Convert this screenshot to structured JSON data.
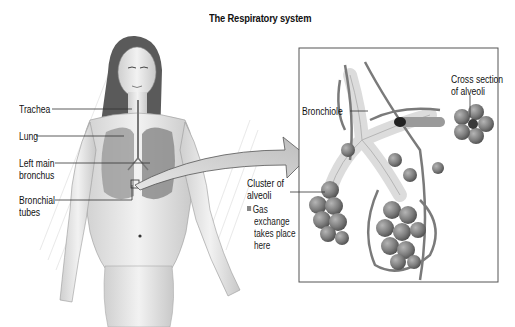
{
  "title": "The Respiratory system",
  "body_labels": {
    "trachea": "Trachea",
    "lung": "Lung",
    "left_main_bronchus_1": "Left main",
    "left_main_bronchus_2": "bronchus",
    "bronchial_tubes_1": "Bronchial",
    "bronchial_tubes_2": "tubes"
  },
  "detail_labels": {
    "bronchiole": "Bronchiole",
    "cross_section_1": "Cross section",
    "cross_section_2": "of alveoli",
    "cluster_1": "Cluster of",
    "cluster_2": "alveoli",
    "note_1": "Gas",
    "note_2": "exchange",
    "note_3": "takes place",
    "note_4": "here"
  },
  "colors": {
    "ink": "#111111",
    "leader_line": "#333333",
    "arrow_fill": "#d0d0d0",
    "alveoli": "#8a8a8a",
    "panel_border": "#555555"
  }
}
